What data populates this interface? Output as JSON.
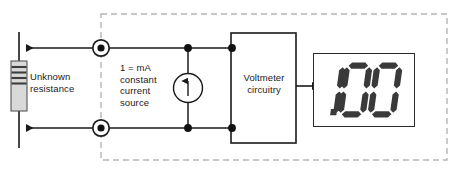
{
  "figure": {
    "background_color": "#ffffff",
    "wire_color": "#1a1a1a",
    "enclosure_border_color": "#b5b5b5"
  },
  "labels": {
    "unknown_resistance": "Unknown\nresistance",
    "current_source": "1 = mA\nconstant\ncurrent\nsource",
    "voltmeter": "Voltmeter\ncircuitry"
  },
  "components": {
    "resistor": {
      "name": "unknown-resistance-resistor",
      "body_color": "#d9d9d9",
      "band_color": "#3d3d3d",
      "band_count": 4
    },
    "terminals": {
      "name": "binding-post-terminal",
      "count": 2,
      "ring_color": "#1a1a1a",
      "dot_color": "#111111"
    },
    "current_source": {
      "name": "constant-current-source-symbol",
      "symbol": "circle-with-up-arrow",
      "value": "1 mA"
    },
    "voltmeter_box": {
      "name": "voltmeter-circuitry-block",
      "fill": "#ffffff",
      "stroke": "#1a1a1a"
    },
    "enclosure": {
      "name": "instrument-enclosure-dashed-boundary",
      "style": "dashed"
    }
  },
  "display": {
    "name": "seven-segment-lcd",
    "reading": "1.00",
    "digits": [
      "1",
      ".",
      "0",
      "0"
    ],
    "segment_color": "#3a3a3a",
    "panel_background": "#ffffff",
    "panel_border_color": "#2b2b2b"
  },
  "arrows": {
    "top_lead_direction": "left",
    "bottom_lead_direction": "left",
    "signal_to_display_direction": "right"
  }
}
